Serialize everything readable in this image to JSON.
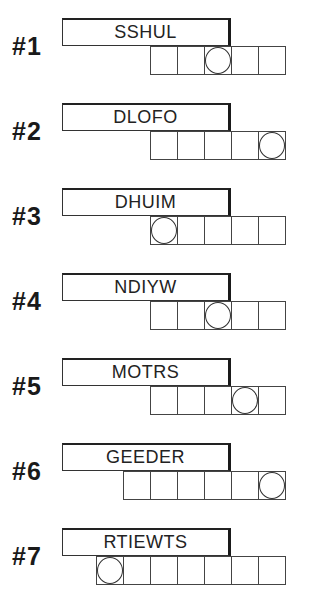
{
  "puzzles": [
    {
      "number": "#1",
      "scramble": "SSHUL",
      "cells": 5,
      "circled": [
        2
      ]
    },
    {
      "number": "#2",
      "scramble": "DLOFO",
      "cells": 5,
      "circled": [
        4
      ]
    },
    {
      "number": "#3",
      "scramble": "DHUIM",
      "cells": 5,
      "circled": [
        0
      ]
    },
    {
      "number": "#4",
      "scramble": "NDIYW",
      "cells": 5,
      "circled": [
        2
      ]
    },
    {
      "number": "#5",
      "scramble": "MOTRS",
      "cells": 5,
      "circled": [
        3
      ]
    },
    {
      "number": "#6",
      "scramble": "GEEDER",
      "cells": 6,
      "circled": [
        5
      ]
    },
    {
      "number": "#7",
      "scramble": "RTIEWTS",
      "cells": 7,
      "circled": [
        0
      ]
    }
  ]
}
